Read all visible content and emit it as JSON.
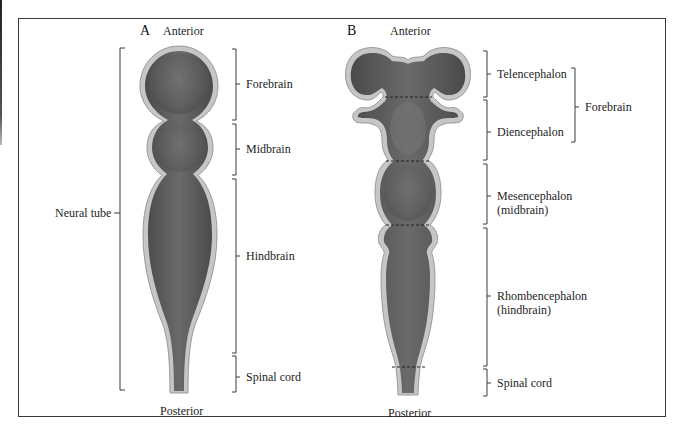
{
  "figure": {
    "panel_a": {
      "letter": "A",
      "top_label": "Anterior",
      "bottom_label": "Posterior",
      "left_bracket_label": "Neural tube",
      "regions": [
        {
          "label": "Forebrain"
        },
        {
          "label": "Midbrain"
        },
        {
          "label": "Hindbrain"
        },
        {
          "label": "Spinal cord"
        }
      ]
    },
    "panel_b": {
      "letter": "B",
      "top_label": "Anterior",
      "bottom_label": "Posterior",
      "regions": [
        {
          "label": "Telencephalon"
        },
        {
          "label": "Diencephalon"
        },
        {
          "label": "Mesencephalon",
          "sublabel": "(midbrain)"
        },
        {
          "label": "Rhombencephalon",
          "sublabel": "(hindbrain)"
        },
        {
          "label": "Spinal cord"
        }
      ],
      "group_bracket_label": "Forebrain"
    },
    "colors": {
      "tissue_fill": "#5e5e5e",
      "tissue_outline": "#c4c4c4",
      "line": "#3a3a3a",
      "frame": "#3a3a3a"
    }
  }
}
